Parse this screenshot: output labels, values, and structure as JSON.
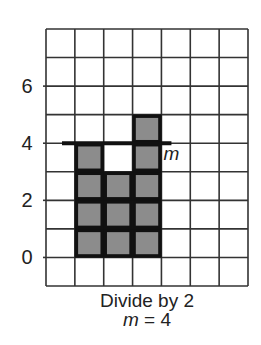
{
  "figure": {
    "type": "grid-bar-diagram",
    "grid": {
      "columns": 7,
      "rows": 9,
      "y_min": -1,
      "y_max": 8,
      "line_color": "#333333",
      "cell_fill": "#ffffff"
    },
    "y_axis_labels": [
      {
        "value": 0,
        "label": "0"
      },
      {
        "value": 2,
        "label": "2"
      },
      {
        "value": 4,
        "label": "4"
      },
      {
        "value": 6,
        "label": "6"
      }
    ],
    "bars": [
      {
        "column": 1,
        "height": 4
      },
      {
        "column": 2,
        "height": 3
      },
      {
        "column": 3,
        "height": 5
      }
    ],
    "bar_fill": "#8c8c8c",
    "bar_border": "#111111",
    "mean_line": {
      "label": "m",
      "value": 4,
      "color": "#111111"
    },
    "caption": {
      "line1": "Divide by 2",
      "line2_var": "m",
      "line2_rest": " = 4"
    }
  },
  "chart_data": {
    "type": "bar",
    "categories": [
      "1",
      "2",
      "3"
    ],
    "values": [
      4,
      3,
      5
    ],
    "title": "",
    "xlabel": "",
    "ylabel": "",
    "ylim": [
      -1,
      8
    ],
    "yticks": [
      0,
      2,
      4,
      6
    ],
    "grid": true,
    "annotations": [
      {
        "type": "hline",
        "y": 4,
        "label": "m"
      }
    ],
    "caption": "Divide by 2, m = 4"
  }
}
